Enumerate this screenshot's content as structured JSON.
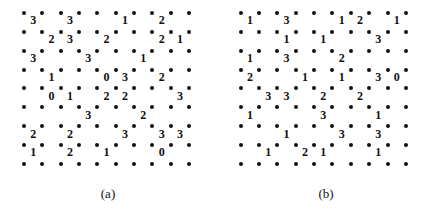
{
  "figure": {
    "puzzles": [
      {
        "id": "a",
        "caption": "(a)",
        "cols": 9,
        "rows": 8,
        "clues": [
          [
            "3",
            "",
            "3",
            "",
            "",
            "1",
            "",
            "2",
            ""
          ],
          [
            "",
            "2",
            "3",
            "",
            "2",
            "",
            "",
            "2",
            "1"
          ],
          [
            "3",
            "",
            "",
            "3",
            "",
            "",
            "1",
            "",
            ""
          ],
          [
            "",
            "1",
            "",
            "",
            "0",
            "3",
            "",
            "2",
            ""
          ],
          [
            "",
            "0",
            "1",
            "",
            "2",
            "2",
            "",
            "",
            "3"
          ],
          [
            "",
            "",
            "",
            "3",
            "",
            "",
            "2",
            "",
            ""
          ],
          [
            "2",
            "",
            "2",
            "",
            "",
            "3",
            "",
            "3",
            "3"
          ],
          [
            "1",
            "",
            "2",
            "",
            "1",
            "",
            "",
            "0",
            ""
          ]
        ]
      },
      {
        "id": "b",
        "caption": "(b)",
        "cols": 9,
        "rows": 8,
        "clues": [
          [
            "1",
            "",
            "3",
            "",
            "",
            "1",
            "2",
            "",
            "1"
          ],
          [
            "",
            "",
            "1",
            "",
            "1",
            "",
            "",
            "3",
            ""
          ],
          [
            "1",
            "",
            "3",
            "",
            "",
            "2",
            "",
            "",
            ""
          ],
          [
            "2",
            "",
            "",
            "1",
            "",
            "1",
            "",
            "3",
            "0"
          ],
          [
            "",
            "3",
            "3",
            "",
            "2",
            "",
            "2",
            "",
            ""
          ],
          [
            "1",
            "",
            "",
            "",
            "3",
            "",
            "",
            "1",
            ""
          ],
          [
            "",
            "",
            "1",
            "",
            "",
            "3",
            "",
            "3",
            ""
          ],
          [
            "",
            "1",
            "",
            "2",
            "1",
            "",
            "",
            "1",
            ""
          ]
        ]
      }
    ]
  }
}
